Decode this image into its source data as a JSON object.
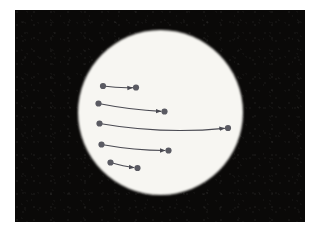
{
  "figure": {
    "title": "",
    "background_color": "#ffffff",
    "frame": {
      "x": 15,
      "y": 10,
      "width": 290,
      "height": 212,
      "fill_color": "#0a0908",
      "border_color": "#0a0908"
    },
    "disk": {
      "name": "solar-disk",
      "center_x": 160.5,
      "center_y": 112.5,
      "radius": 82.5,
      "fill_color": "#f7f6f2",
      "edge_softness_px": 1.5
    },
    "arrows": {
      "stroke_color": "#4a4a52",
      "dot_color": "#5a5a62",
      "stroke_width": 1.1,
      "dot_radius": 3.1,
      "count": 5,
      "items": [
        {
          "id": "arrow-1",
          "label": "displacement-track-1",
          "start_x": 103.0,
          "start_y": 86.0,
          "end_x": 136.0,
          "end_y": 87.5,
          "control_x": 119.5,
          "control_y": 88.3,
          "length_px": 33.0,
          "arrowhead_at": "end"
        },
        {
          "id": "arrow-2",
          "label": "displacement-track-2",
          "start_x": 98.5,
          "start_y": 103.5,
          "end_x": 164.5,
          "end_y": 111.5,
          "control_x": 131.5,
          "control_y": 110.0,
          "length_px": 66.5,
          "arrowhead_at": "end"
        },
        {
          "id": "arrow-3",
          "label": "displacement-track-3",
          "start_x": 99.5,
          "start_y": 123.5,
          "end_x": 228.0,
          "end_y": 128.0,
          "control_x": 163.0,
          "control_y": 134.5,
          "length_px": 128.6,
          "arrowhead_at": "end"
        },
        {
          "id": "arrow-4",
          "label": "displacement-track-4",
          "start_x": 101.5,
          "start_y": 144.5,
          "end_x": 168.5,
          "end_y": 150.5,
          "control_x": 135.0,
          "control_y": 150.5,
          "length_px": 67.3,
          "arrowhead_at": "end"
        },
        {
          "id": "arrow-5",
          "label": "displacement-track-5",
          "start_x": 110.5,
          "start_y": 162.5,
          "end_x": 137.5,
          "end_y": 168.0,
          "control_x": 124.0,
          "control_y": 166.3,
          "length_px": 27.6,
          "arrowhead_at": "end"
        }
      ]
    }
  }
}
